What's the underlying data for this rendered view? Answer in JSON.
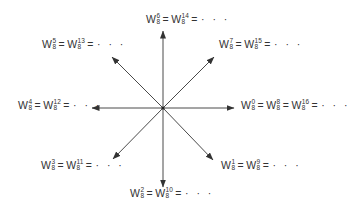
{
  "diagram": {
    "type": "roots-of-unity-arrows",
    "base": "W",
    "subscript": "8",
    "center": [
      163,
      108
    ],
    "arrow_color": "#4a4a4a",
    "arrows": [
      {
        "direction": "up",
        "tip": [
          163,
          31
        ]
      },
      {
        "direction": "up-right",
        "tip": [
          214,
          57
        ]
      },
      {
        "direction": "right",
        "tip": [
          234,
          108
        ]
      },
      {
        "direction": "down-right",
        "tip": [
          213,
          160
        ]
      },
      {
        "direction": "down",
        "tip": [
          163,
          187
        ]
      },
      {
        "direction": "down-left",
        "tip": [
          113,
          159
        ]
      },
      {
        "direction": "left",
        "tip": [
          92,
          108
        ]
      },
      {
        "direction": "up-left",
        "tip": [
          112,
          57
        ]
      }
    ],
    "labels": {
      "top": {
        "exponents": [
          "6",
          "14"
        ],
        "ellipsis": "· · ·"
      },
      "top_right": {
        "exponents": [
          "7",
          "15"
        ],
        "ellipsis": "· · ·"
      },
      "right": {
        "exponents": [
          "0",
          "8",
          "16"
        ],
        "ellipsis": "· · ·"
      },
      "bottom_right": {
        "exponents": [
          "1",
          "9"
        ],
        "ellipsis": "· · ·"
      },
      "bottom": {
        "exponents": [
          "2",
          "10"
        ],
        "ellipsis": "· · ·"
      },
      "bottom_left": {
        "exponents": [
          "3",
          "11"
        ],
        "ellipsis": "· · ·"
      },
      "left": {
        "exponents": [
          "4",
          "12"
        ],
        "ellipsis": "· · ·"
      },
      "top_left": {
        "exponents": [
          "5",
          "13"
        ],
        "ellipsis": "· · ·"
      }
    },
    "equals": "="
  }
}
